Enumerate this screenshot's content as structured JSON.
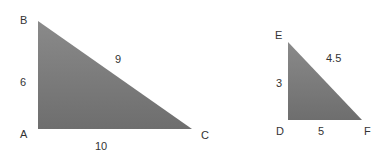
{
  "diagram": {
    "fill_color_top": "#8a8a8a",
    "fill_color_bottom": "#6e6e6e",
    "label_color": "#333333",
    "triangles": [
      {
        "name": "ABC",
        "vertices": {
          "right_angle": "A",
          "top": "B",
          "right": "C"
        },
        "sides": {
          "vertical": "6",
          "hypotenuse": "9",
          "base": "10"
        }
      },
      {
        "name": "DEF",
        "vertices": {
          "right_angle": "D",
          "top": "E",
          "right": "F"
        },
        "sides": {
          "vertical": "3",
          "hypotenuse": "4.5",
          "base": "5"
        }
      }
    ]
  }
}
